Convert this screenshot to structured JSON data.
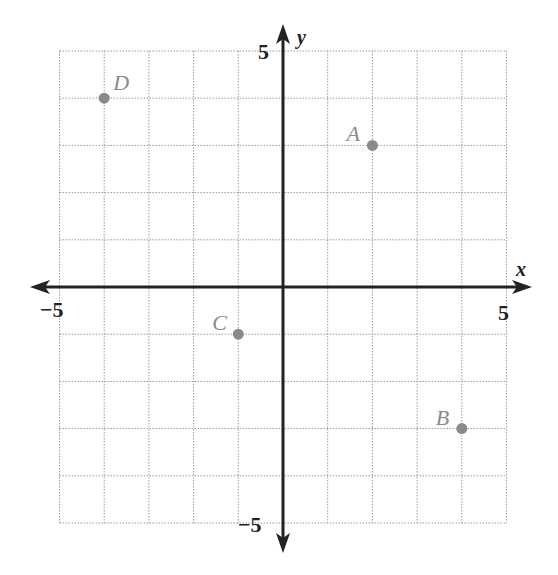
{
  "chart_data": {
    "type": "scatter",
    "title": "",
    "xlabel": "x",
    "ylabel": "y",
    "xlim": [
      -5,
      5
    ],
    "ylim": [
      -5,
      5
    ],
    "grid": true,
    "grid_style": "dotted",
    "x_tick_labels": [
      {
        "value": -5,
        "label": "−5"
      },
      {
        "value": 5,
        "label": "5"
      }
    ],
    "y_tick_labels": [
      {
        "value": 5,
        "label": "5"
      },
      {
        "value": -5,
        "label": "−5"
      }
    ],
    "points": [
      {
        "name": "A",
        "x": 2,
        "y": 3
      },
      {
        "name": "B",
        "x": 4,
        "y": -3
      },
      {
        "name": "C",
        "x": -1,
        "y": -1
      },
      {
        "name": "D",
        "x": -4,
        "y": 4
      }
    ],
    "legend": null
  },
  "colors": {
    "axis": "#222222",
    "grid": "#9a9a9a",
    "point": "#8a8a8a",
    "point_label": "#8a8a8a",
    "background": "#ffffff"
  },
  "layout": {
    "origin_px": [
      283,
      287
    ],
    "unit_x_px": 44.7,
    "unit_y_px": 47.2
  }
}
